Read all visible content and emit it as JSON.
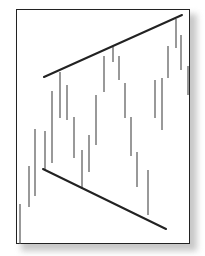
{
  "chart_data": {
    "type": "bar",
    "subtype": "price-bars-with-broadening-wedge-trendlines",
    "title": "",
    "xlabel": "",
    "ylabel": "",
    "grid": false,
    "legend": null,
    "bar_color": "#555555",
    "trendline_color": "#222222",
    "bars": [
      {
        "x": 20,
        "top": 204,
        "bottom": 244
      },
      {
        "x": 29,
        "top": 166,
        "bottom": 207
      },
      {
        "x": 35,
        "top": 129,
        "bottom": 196
      },
      {
        "x": 45,
        "top": 131,
        "bottom": 170
      },
      {
        "x": 52,
        "top": 91,
        "bottom": 163
      },
      {
        "x": 60,
        "top": 72,
        "bottom": 118
      },
      {
        "x": 67,
        "top": 85,
        "bottom": 120
      },
      {
        "x": 74,
        "top": 117,
        "bottom": 158
      },
      {
        "x": 82,
        "top": 150,
        "bottom": 189
      },
      {
        "x": 89,
        "top": 135,
        "bottom": 172
      },
      {
        "x": 96,
        "top": 95,
        "bottom": 145
      },
      {
        "x": 104,
        "top": 56,
        "bottom": 92
      },
      {
        "x": 113,
        "top": 47,
        "bottom": 62
      },
      {
        "x": 119,
        "top": 56,
        "bottom": 80
      },
      {
        "x": 125,
        "top": 83,
        "bottom": 118
      },
      {
        "x": 131,
        "top": 117,
        "bottom": 156
      },
      {
        "x": 137,
        "top": 152,
        "bottom": 187
      },
      {
        "x": 148,
        "top": 170,
        "bottom": 215
      },
      {
        "x": 155,
        "top": 80,
        "bottom": 118
      },
      {
        "x": 162,
        "top": 78,
        "bottom": 130
      },
      {
        "x": 168,
        "top": 46,
        "bottom": 78
      },
      {
        "x": 176,
        "top": 19,
        "bottom": 48
      },
      {
        "x": 181,
        "top": 35,
        "bottom": 70
      },
      {
        "x": 188,
        "top": 66,
        "bottom": 95
      }
    ],
    "trendlines": [
      {
        "name": "upper-resistance",
        "x1": 44,
        "y1": 77,
        "x2": 182,
        "y2": 15
      },
      {
        "name": "lower-support",
        "x1": 43,
        "y1": 169,
        "x2": 166,
        "y2": 229
      }
    ]
  }
}
